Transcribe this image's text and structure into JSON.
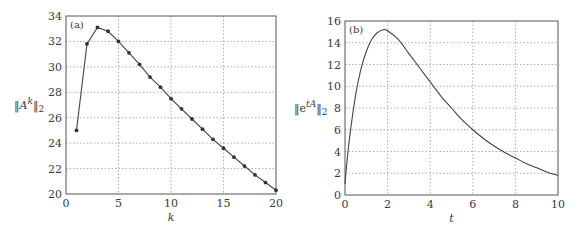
{
  "chart_data": [
    {
      "type": "line",
      "panel_label": "(a)",
      "title": "",
      "xlabel": "k",
      "ylabel": "‖A^k‖_2",
      "ylabel_parts": {
        "open": "‖A",
        "sup": "k",
        "close": "‖",
        "sub": "2"
      },
      "xlim": [
        0,
        20
      ],
      "ylim": [
        20,
        34
      ],
      "xticks": [
        0,
        5,
        10,
        15,
        20
      ],
      "yticks": [
        20,
        22,
        24,
        26,
        28,
        30,
        32,
        34
      ],
      "grid": true,
      "markers": true,
      "x": [
        1,
        2,
        3,
        4,
        5,
        6,
        7,
        8,
        9,
        10,
        11,
        12,
        13,
        14,
        15,
        16,
        17,
        18,
        19,
        20
      ],
      "values": [
        25.0,
        31.8,
        33.1,
        32.8,
        32.0,
        31.1,
        30.2,
        29.2,
        28.4,
        27.5,
        26.7,
        25.9,
        25.1,
        24.3,
        23.6,
        22.9,
        22.2,
        21.5,
        20.9,
        20.3
      ]
    },
    {
      "type": "line",
      "panel_label": "(b)",
      "title": "",
      "xlabel": "t",
      "ylabel": "‖e^{tA}‖_2",
      "ylabel_parts": {
        "open": "‖e",
        "sup": "tA",
        "close": "‖",
        "sub": "2"
      },
      "xlim": [
        0,
        10
      ],
      "ylim": [
        0,
        16
      ],
      "xticks": [
        0,
        2,
        4,
        6,
        8,
        10
      ],
      "yticks": [
        0,
        2,
        4,
        6,
        8,
        10,
        12,
        14,
        16
      ],
      "grid": true,
      "markers": false,
      "x": [
        0,
        0.1,
        0.25,
        0.5,
        0.75,
        1.0,
        1.25,
        1.5,
        1.8,
        2.0,
        2.5,
        3.0,
        3.5,
        4.0,
        4.5,
        5.0,
        5.5,
        6.0,
        6.5,
        7.0,
        7.5,
        8.0,
        8.5,
        9.0,
        9.5,
        10.0
      ],
      "values": [
        1.0,
        3.2,
        5.8,
        9.2,
        11.6,
        13.2,
        14.3,
        14.9,
        15.2,
        15.1,
        14.3,
        13.0,
        11.7,
        10.4,
        9.1,
        8.0,
        6.9,
        6.0,
        5.2,
        4.5,
        3.9,
        3.4,
        2.9,
        2.5,
        2.1,
        1.8
      ]
    }
  ]
}
